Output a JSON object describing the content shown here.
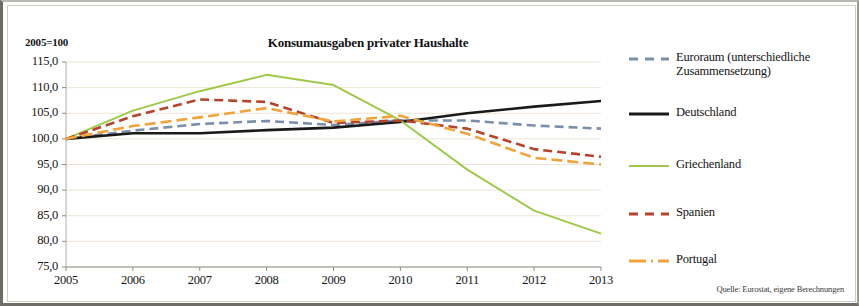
{
  "figure": {
    "axis_unit_label": "2005=100",
    "title": "Konsumausgaben privater Haushalte",
    "source": "Quelle: Eurostat, eigene Berechnungen"
  },
  "legend": {
    "items": [
      {
        "label": "Euroraum (unterschiedliche Zusammensetzung)",
        "color": "#7b8faa",
        "style": "dashed"
      },
      {
        "label": "Deutschland",
        "color": "#1a1a1a",
        "style": "solid"
      },
      {
        "label": "Griechenland",
        "color": "#9fc84a",
        "style": "solid"
      },
      {
        "label": "Spanien",
        "color": "#b4442c",
        "style": "dashed"
      },
      {
        "label": "Portugal",
        "color": "#f0a33c",
        "style": "dashdot"
      }
    ]
  },
  "chart_data": {
    "type": "line",
    "title": "Konsumausgaben privater Haushalte",
    "xlabel": "",
    "ylabel": "2005=100",
    "x": [
      2005,
      2006,
      2007,
      2008,
      2009,
      2010,
      2011,
      2012,
      2013
    ],
    "xtick_labels": [
      "2005",
      "2006",
      "2007",
      "2008",
      "2009",
      "2010",
      "2011",
      "2012",
      "2013"
    ],
    "ytick_labels": [
      "75,0",
      "80,0",
      "85,0",
      "90,0",
      "95,0",
      "100,0",
      "105,0",
      "110,0",
      "115,0"
    ],
    "ylim": [
      75.0,
      115.0
    ],
    "ytick_step": 5.0,
    "xlim": [
      2005,
      2013
    ],
    "grid": true,
    "legend_position": "right",
    "series": [
      {
        "name": "Euroraum (unterschiedliche Zusammensetzung)",
        "color": "#7b8faa",
        "style": "dashed",
        "values": [
          100.0,
          101.6,
          102.9,
          103.5,
          102.7,
          103.6,
          103.6,
          102.6,
          102.0
        ]
      },
      {
        "name": "Deutschland",
        "color": "#1a1a1a",
        "style": "solid",
        "values": [
          100.0,
          101.1,
          101.1,
          101.7,
          102.2,
          103.3,
          105.0,
          106.3,
          107.4
        ]
      },
      {
        "name": "Griechenland",
        "color": "#9fc84a",
        "style": "solid",
        "values": [
          100.0,
          105.5,
          109.3,
          112.5,
          110.5,
          103.6,
          94.0,
          86.0,
          81.5
        ]
      },
      {
        "name": "Spanien",
        "color": "#b4442c",
        "style": "dashed",
        "values": [
          100.0,
          104.4,
          107.7,
          107.2,
          103.1,
          103.6,
          102.0,
          98.0,
          96.5
        ]
      },
      {
        "name": "Portugal",
        "color": "#f0a33c",
        "style": "dashdot",
        "values": [
          100.0,
          102.5,
          104.2,
          106.0,
          103.4,
          104.5,
          101.0,
          96.3,
          95.0
        ]
      }
    ]
  }
}
